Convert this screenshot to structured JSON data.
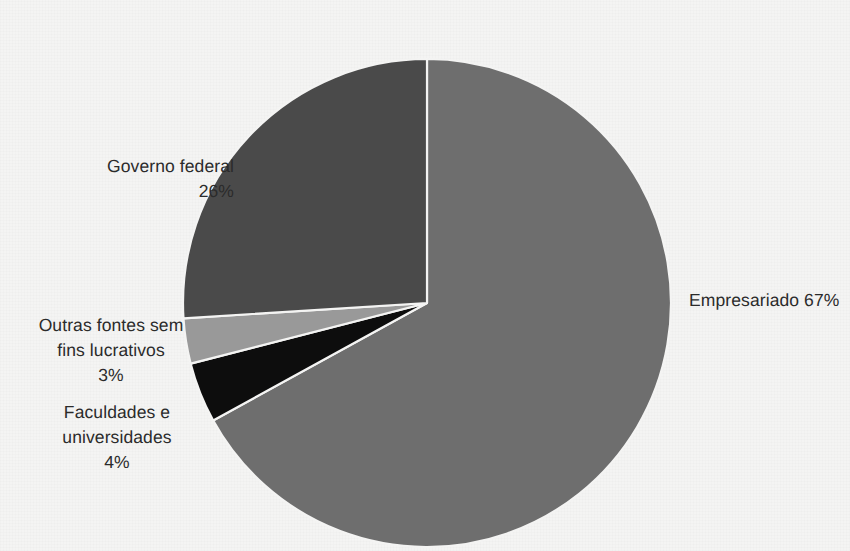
{
  "figure": {
    "title_remnant": "",
    "background_color": "#f4f4f3",
    "text_color": "#2b2b2b"
  },
  "chart_data": {
    "type": "pie",
    "title": "",
    "subtitle": "",
    "xlabel": "",
    "ylabel": "",
    "grid": false,
    "legend_position": "none",
    "units": "percent",
    "total": 100,
    "start_angle_deg": 0,
    "direction": "clockwise",
    "center": {
      "x": 427,
      "y": 303
    },
    "radius": 244,
    "cropped_edges": [
      "bottom"
    ],
    "categories": [
      "Empresariado",
      "Faculdades e universidades",
      "Outras fontes sem fins lucrativos",
      "Governo federal"
    ],
    "values": [
      67,
      4,
      3,
      26
    ],
    "colors": [
      "#6e6e6e",
      "#0d0d0d",
      "#999999",
      "#4a4a4a"
    ],
    "slices": [
      {
        "name": "Empresariado",
        "value": 67,
        "value_text": "67%",
        "color": "#6e6e6e",
        "label_text": "Empresariado 67%",
        "label_position": "right"
      },
      {
        "name": "Faculdades e universidades",
        "value": 4,
        "value_text": "4%",
        "color": "#0d0d0d",
        "label_text": "Faculdades e\nuniversidades\n4%",
        "label_position": "lower-left"
      },
      {
        "name": "Outras fontes sem fins lucrativos",
        "value": 3,
        "value_text": "3%",
        "color": "#999999",
        "label_text": "Outras fontes sem\nfins lucrativos\n3%",
        "label_position": "left"
      },
      {
        "name": "Governo federal",
        "value": 26,
        "value_text": "26%",
        "color": "#4a4a4a",
        "label_text": "Governo federal\n26%",
        "label_position": "upper-left"
      }
    ],
    "slice_separator_color": "#f4f4f3"
  }
}
